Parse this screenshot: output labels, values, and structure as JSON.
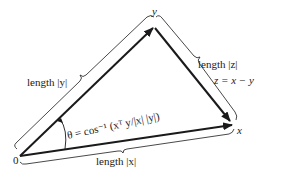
{
  "diagram": {
    "origin_label": "0",
    "vertex_y_label": "y",
    "vertex_x_label": "x",
    "label_length_y": "length |y|",
    "label_length_z": "length |z|",
    "label_z_def": "z = x − y",
    "label_length_x": "length |x|",
    "angle_formula": "θ = cos⁻¹ (xᵀ y/|x| |y|)",
    "stroke_color": "#1a1a1a"
  }
}
